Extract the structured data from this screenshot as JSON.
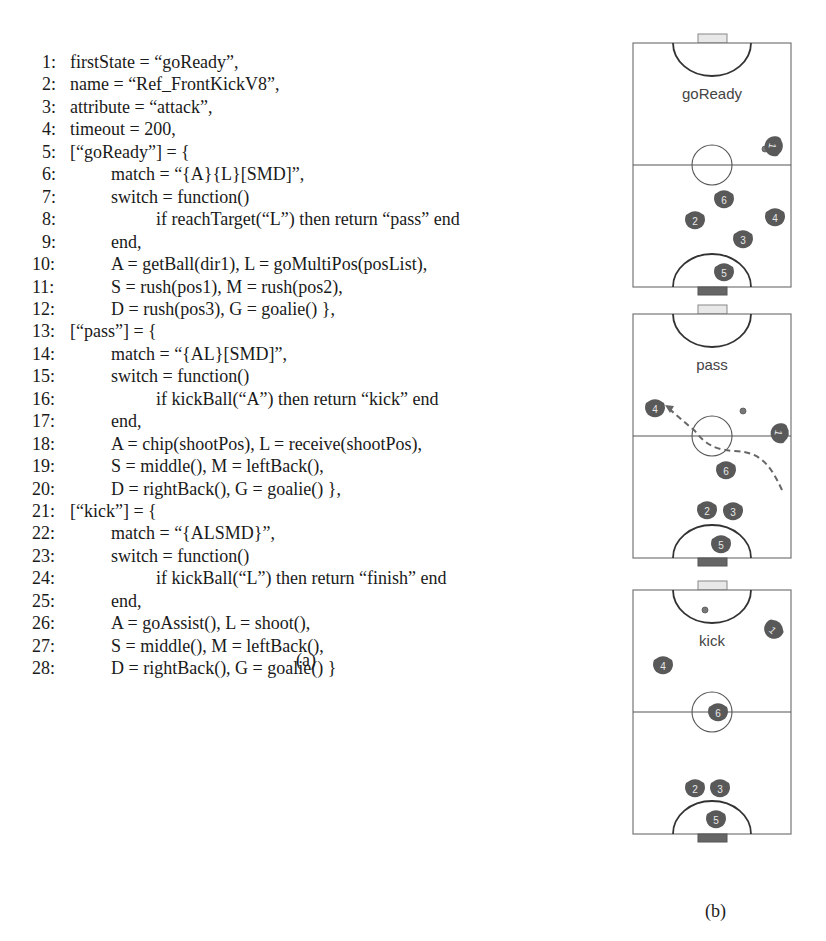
{
  "figure": {
    "code_caption": "(a)",
    "fields_caption": "(b)",
    "code_lines": [
      {
        "num": "1:",
        "indent": 0,
        "text": "firstState = “goReady”,"
      },
      {
        "num": "2:",
        "indent": 0,
        "text": "name = “Ref_FrontKickV8”,"
      },
      {
        "num": "3:",
        "indent": 0,
        "text": "attribute = “attack”,"
      },
      {
        "num": "4:",
        "indent": 0,
        "text": "timeout = 200,"
      },
      {
        "num": "5:",
        "indent": 0,
        "text": "[“goReady”] = {"
      },
      {
        "num": "6:",
        "indent": 1,
        "text": "match = “{A}{L}[SMD]”,"
      },
      {
        "num": "7:",
        "indent": 1,
        "text": "switch = function()"
      },
      {
        "num": "8:",
        "indent": 2,
        "text": "if reachTarget(“L”) then return “pass” end"
      },
      {
        "num": "9:",
        "indent": 1,
        "text": "end,"
      },
      {
        "num": "10:",
        "indent": 1,
        "text": "A = getBall(dir1), L = goMultiPos(posList),"
      },
      {
        "num": "11:",
        "indent": 1,
        "text": "S = rush(pos1), M = rush(pos2),"
      },
      {
        "num": "12:",
        "indent": 1,
        "text": "D = rush(pos3), G = goalie() },"
      },
      {
        "num": "13:",
        "indent": 0,
        "text": "[“pass”] = {"
      },
      {
        "num": "14:",
        "indent": 1,
        "text": "match = “{AL}[SMD]”,"
      },
      {
        "num": "15:",
        "indent": 1,
        "text": "switch = function()"
      },
      {
        "num": "16:",
        "indent": 2,
        "text": "if kickBall(“A”) then return “kick” end"
      },
      {
        "num": "17:",
        "indent": 1,
        "text": "end,"
      },
      {
        "num": "18:",
        "indent": 1,
        "text": "A = chip(shootPos), L = receive(shootPos),"
      },
      {
        "num": "19:",
        "indent": 1,
        "text": "S = middle(), M = leftBack(),"
      },
      {
        "num": "20:",
        "indent": 1,
        "text": "D = rightBack(), G = goalie() },"
      },
      {
        "num": "21:",
        "indent": 0,
        "text": "[“kick”] = {"
      },
      {
        "num": "22:",
        "indent": 1,
        "text": "match = “{ALSMD}”,"
      },
      {
        "num": "23:",
        "indent": 1,
        "text": "switch = function()"
      },
      {
        "num": "24:",
        "indent": 2,
        "text": "if kickBall(“L”) then return “finish” end"
      },
      {
        "num": "25:",
        "indent": 1,
        "text": "end,"
      },
      {
        "num": "26:",
        "indent": 1,
        "text": "A = goAssist(), L = shoot(),"
      },
      {
        "num": "27:",
        "indent": 1,
        "text": "S = middle(), M = leftBack(),"
      },
      {
        "num": "28:",
        "indent": 1,
        "text": "D = rightBack(), G = goalie() }"
      }
    ],
    "fields": [
      {
        "label": "goReady",
        "top": 34,
        "robots": [
          {
            "id": "1",
            "x": 773,
            "y": 146,
            "rot": 100
          },
          {
            "id": "6",
            "x": 724,
            "y": 200,
            "rot": 0
          },
          {
            "id": "2",
            "x": 695,
            "y": 221,
            "rot": 0
          },
          {
            "id": "4",
            "x": 775,
            "y": 218,
            "rot": 0
          },
          {
            "id": "3",
            "x": 743,
            "y": 240,
            "rot": 0
          },
          {
            "id": "5",
            "x": 724,
            "y": 273,
            "rot": 0
          }
        ],
        "ball": {
          "x": 765,
          "y": 149
        }
      },
      {
        "label": "pass",
        "top": 305,
        "robots": [
          {
            "id": "4",
            "x": 655,
            "y": 409,
            "rot": 0
          },
          {
            "id": "1",
            "x": 779,
            "y": 433,
            "rot": 100
          },
          {
            "id": "6",
            "x": 726,
            "y": 471,
            "rot": 0
          },
          {
            "id": "2",
            "x": 707,
            "y": 511,
            "rot": 0
          },
          {
            "id": "3",
            "x": 733,
            "y": 512,
            "rot": 0
          },
          {
            "id": "5",
            "x": 721,
            "y": 545,
            "rot": 0
          }
        ],
        "ball": {
          "x": 743,
          "y": 411
        }
      },
      {
        "label": "kick",
        "top": 581,
        "robots": [
          {
            "id": "1",
            "x": 773,
            "y": 630,
            "rot": 45
          },
          {
            "id": "4",
            "x": 663,
            "y": 666,
            "rot": 0
          },
          {
            "id": "6",
            "x": 718,
            "y": 713,
            "rot": 0
          },
          {
            "id": "2",
            "x": 695,
            "y": 789,
            "rot": 0
          },
          {
            "id": "3",
            "x": 720,
            "y": 789,
            "rot": 0
          },
          {
            "id": "5",
            "x": 716,
            "y": 820,
            "rot": 0
          }
        ],
        "ball": {
          "x": 705,
          "y": 610
        }
      }
    ]
  }
}
